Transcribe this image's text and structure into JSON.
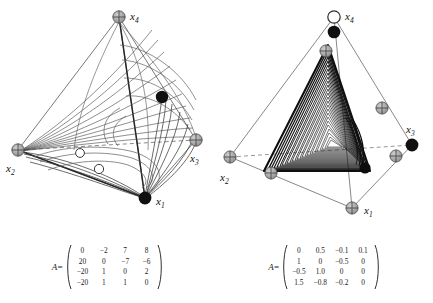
{
  "figure": {
    "type": "two-panel simplex phase portrait with coefficient matrices",
    "panels": [
      {
        "id": "left",
        "vertex_labels": [
          "x_1",
          "x_2",
          "x_3",
          "x_4"
        ],
        "vertices": [
          {
            "label": "x1",
            "sub": "1",
            "marker": "filled-black-circle",
            "x": 145,
            "y": 198
          },
          {
            "label": "x2",
            "sub": "2",
            "marker": "gray-crosshair-circle",
            "x": 18,
            "y": 150
          },
          {
            "label": "x3",
            "sub": "3",
            "marker": "gray-crosshair-circle",
            "x": 196,
            "y": 140
          },
          {
            "label": "x4",
            "sub": "4",
            "marker": "gray-crosshair-circle",
            "x": 119,
            "y": 17
          }
        ],
        "interior_markers": [
          {
            "marker": "filled-black-circle",
            "note": "on x4-x3 edge",
            "x": 162,
            "y": 97
          },
          {
            "marker": "open-white-circle",
            "x": 80,
            "y": 153
          },
          {
            "marker": "open-white-circle",
            "x": 99,
            "y": 168
          }
        ],
        "trajectory": "fan of orbits converging toward x2 and x1",
        "dashed_edge": "x2-x3 (hidden back edge)"
      },
      {
        "id": "right",
        "vertex_labels": [
          "x_1",
          "x_2",
          "x_3",
          "x_4"
        ],
        "vertices": [
          {
            "label": "x1",
            "sub": "1",
            "marker": "gray-crosshair-circle",
            "x": 136,
            "y": 208
          },
          {
            "label": "x2",
            "sub": "2",
            "marker": "gray-crosshair-circle",
            "x": 14,
            "y": 157
          },
          {
            "label": "x3",
            "sub": "3",
            "marker": "filled-black-circle",
            "x": 196,
            "y": 145
          },
          {
            "label": "x4",
            "sub": "4",
            "marker": "open-white-circle",
            "x": 118,
            "y": 17
          }
        ],
        "interior_markers": [
          {
            "marker": "filled-black-circle",
            "note": "below x4",
            "x": 118,
            "y": 32
          },
          {
            "marker": "gray-crosshair-circle",
            "note": "on x4-x2 edge",
            "x": 110,
            "y": 51
          },
          {
            "marker": "gray-crosshair-circle",
            "note": "on x4-x3 edge",
            "x": 165,
            "y": 108
          },
          {
            "marker": "gray-crosshair-circle",
            "note": "on x3-x1 edge",
            "x": 180,
            "y": 155
          },
          {
            "marker": "gray-crosshair-circle",
            "note": "on x2-x1 edge",
            "x": 55,
            "y": 172
          },
          {
            "marker": "filled-black-circle",
            "note": "attractor lower-right corner",
            "x": 145,
            "y": 163
          }
        ],
        "trajectory": "chaotic attractor, triangular spiral band",
        "dashed_edge": "x2-x3 (hidden back edge)"
      }
    ],
    "matrices": [
      {
        "panel": "left",
        "label": "A",
        "equals": "=",
        "rows": [
          [
            "0",
            "−2",
            "7",
            "8"
          ],
          [
            "20",
            "0",
            "−7",
            "−6"
          ],
          [
            "−20",
            "1",
            "0",
            "2"
          ],
          [
            "−20",
            "1",
            "1",
            "0"
          ]
        ]
      },
      {
        "panel": "right",
        "label": "A",
        "equals": "=",
        "rows": [
          [
            "0",
            "0.5",
            "−0.1",
            "0.1"
          ],
          [
            "1",
            "0",
            "−0.5",
            "0"
          ],
          [
            "−0.5",
            "1.0",
            "0",
            "0"
          ],
          [
            "1.5",
            "−0.8",
            "−0.2",
            "0"
          ]
        ]
      }
    ],
    "colors": {
      "ink": "#1a1a1a",
      "edge": "#6f6f6f",
      "marker_gray": "#9a9a9a",
      "marker_black": "#111111",
      "background": "#ffffff"
    }
  }
}
